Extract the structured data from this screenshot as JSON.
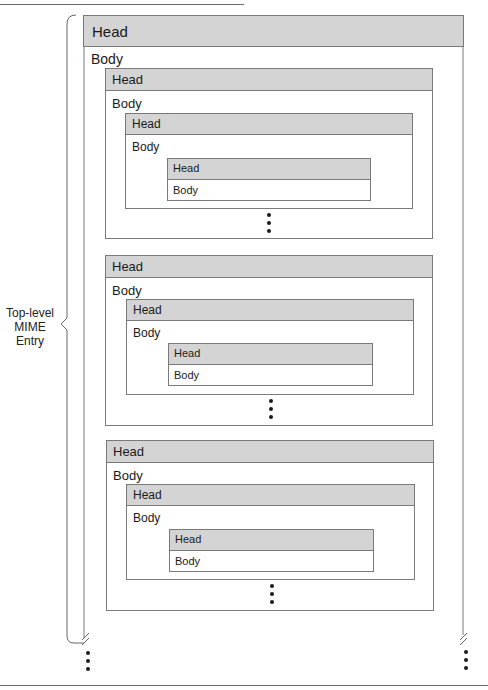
{
  "diagram": {
    "brace_label": [
      "Top-level",
      "MIME",
      "Entry"
    ],
    "outer": {
      "head": "Head",
      "body": "Body"
    },
    "groups": [
      {
        "level2": {
          "head": "Head",
          "body": "Body"
        },
        "level3": {
          "head": "Head",
          "body": "Body"
        },
        "level4": {
          "head": "Head",
          "body": "Body"
        }
      },
      {
        "level2": {
          "head": "Head",
          "body": "Body"
        },
        "level3": {
          "head": "Head",
          "body": "Body"
        },
        "level4": {
          "head": "Head",
          "body": "Body"
        }
      },
      {
        "level2": {
          "head": "Head",
          "body": "Body"
        },
        "level3": {
          "head": "Head",
          "body": "Body"
        },
        "level4": {
          "head": "Head",
          "body": "Body"
        }
      }
    ],
    "continuation_marker": "ellipsis-vertical"
  }
}
